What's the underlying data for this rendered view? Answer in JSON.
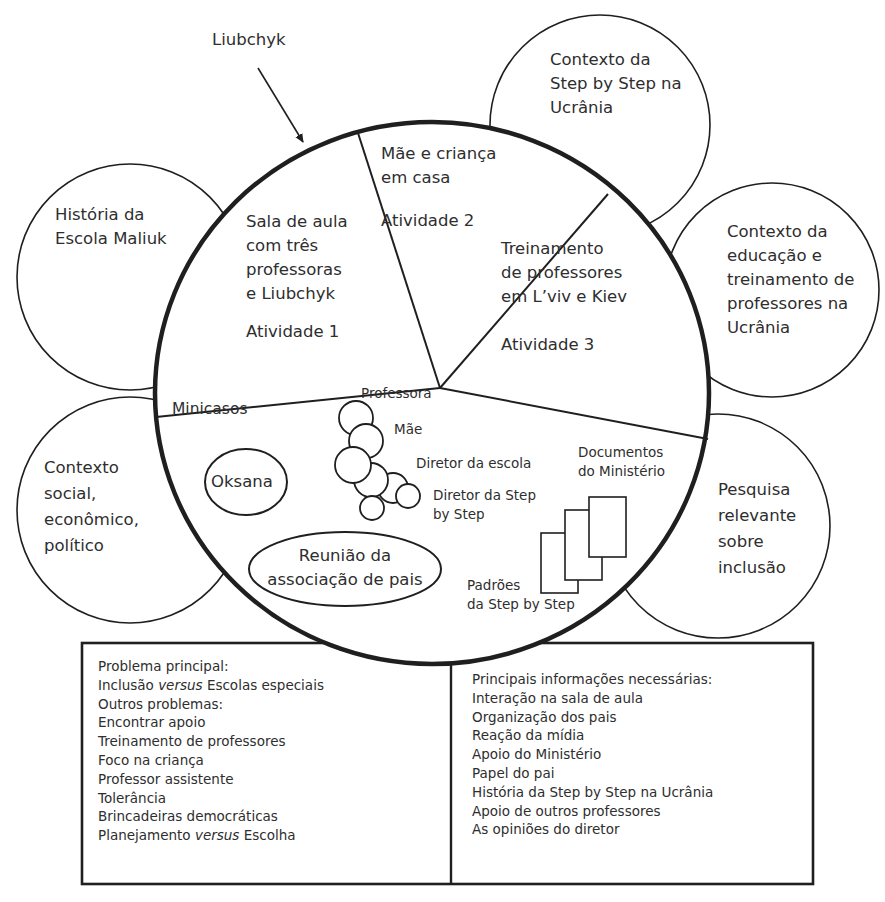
{
  "arrow_label": "Liubchyk",
  "outer_circles": {
    "historia": [
      "História da",
      "Escola Maliuk"
    ],
    "contexto_step": [
      "Contexto da",
      "Step by Step na",
      "Ucrânia"
    ],
    "contexto_educacao": [
      "Contexto da",
      "educação e",
      "treinamento de",
      "professores na",
      "Ucrânia"
    ],
    "contexto_social": [
      "Contexto",
      "social,",
      "econômico,",
      "político"
    ],
    "pesquisa": [
      "Pesquisa",
      "relevante",
      "sobre",
      "inclusão"
    ]
  },
  "sectors": {
    "atividade1": {
      "lines": [
        "Sala de aula",
        "com três",
        "professoras",
        "e Liubchyk"
      ],
      "activity": "Atividade 1"
    },
    "atividade2": {
      "lines": [
        "Mãe e criança",
        "em casa"
      ],
      "activity": "Atividade 2"
    },
    "atividade3": {
      "lines": [
        "Treinamento",
        "de professores",
        "em L’viv e Kiev"
      ],
      "activity": "Atividade 3"
    },
    "minicasos": {
      "title": "Minicasos",
      "oksana": "Oksana",
      "reuniao": [
        "Reunião da",
        "associação de pais"
      ],
      "people": {
        "professora": "Professora",
        "mae": "Mãe",
        "diretor_escola": "Diretor da escola",
        "diretor_step": [
          "Diretor da Step",
          "by Step"
        ]
      },
      "documentos": [
        "Documentos",
        "do Ministério"
      ],
      "padroes": [
        "Padrões",
        "da Step by Step"
      ]
    }
  },
  "box_left": {
    "heading": "Problema principal:",
    "main_problem": {
      "pre": "Inclusão ",
      "italic": "versus",
      "post": " Escolas especiais"
    },
    "other_heading": "Outros problemas:",
    "items": [
      "Encontrar apoio",
      "Treinamento de professores",
      "Foco na criança",
      "Professor assistente",
      "Tolerância",
      "Brincadeiras democráticas"
    ],
    "last_item": {
      "pre": "Planejamento ",
      "italic": "versus",
      "post": " Escolha"
    }
  },
  "box_right": {
    "heading": "Principais informações necessárias:",
    "items": [
      "Interação na sala de aula",
      "Organização dos pais",
      "Reação da mídia",
      "Apoio do Ministério",
      "Papel do pai",
      "História da Step by Step na Ucrânia",
      "Apoio de outros professores",
      "As opiniões do diretor"
    ]
  },
  "colors": {
    "stroke": "#1f1f1f",
    "text": "#2e2e2e",
    "background": "#ffffff"
  }
}
